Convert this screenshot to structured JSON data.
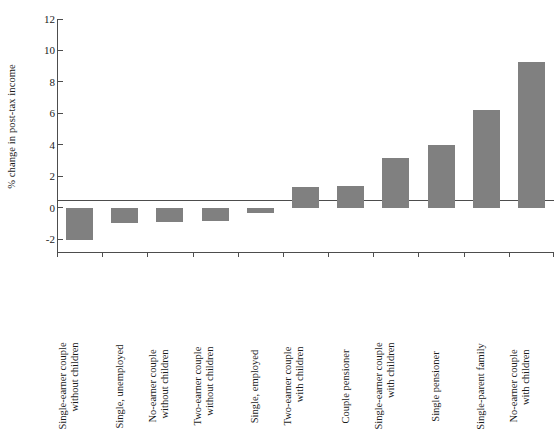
{
  "chart_data": {
    "type": "bar",
    "title": "",
    "xlabel": "",
    "ylabel": "% change in post-tax income",
    "ylim": [
      -2.8,
      12
    ],
    "yticks": [
      -2,
      0,
      2,
      4,
      6,
      8,
      10,
      12
    ],
    "ytick_labels": [
      "-2",
      "0",
      "2",
      "4",
      "6",
      "8",
      "10",
      "12"
    ],
    "grid": false,
    "legend": "none",
    "bar_color": "#808080",
    "axis_color": "#4d4d4d",
    "categories": [
      "Single-earner couple without children",
      "Single, unemployed",
      "No-earner couple without children",
      "Two-earner couple without children",
      "Single, employed",
      "Two-earner couple with children",
      "Couple pensioner",
      "Single-earner couple with children",
      "Single pensioner",
      "Single-parent family",
      "No-earner couple with children"
    ],
    "category_lines": [
      [
        "Single-earner couple",
        "without children"
      ],
      [
        "Single, unemployed",
        ""
      ],
      [
        "No-earner couple",
        "without children"
      ],
      [
        "Two-earner couple",
        "without children"
      ],
      [
        "Single, employed",
        ""
      ],
      [
        "Two-earner couple",
        "with children"
      ],
      [
        "Couple pensioner",
        ""
      ],
      [
        "Single-earner couple",
        "with children"
      ],
      [
        "Single pensioner",
        ""
      ],
      [
        "Single-parent family",
        ""
      ],
      [
        "No-earner couple",
        "with children"
      ]
    ],
    "values": [
      -2.05,
      -0.95,
      -0.9,
      -0.85,
      -0.3,
      1.3,
      1.4,
      3.2,
      4.0,
      6.2,
      9.3
    ]
  },
  "top_artifact": "",
  "icons": {}
}
